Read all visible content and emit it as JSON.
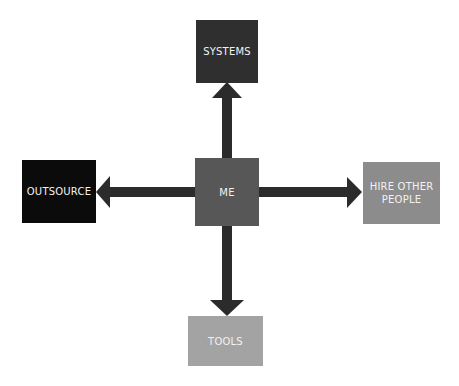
{
  "diagram": {
    "center": {
      "label": "ME",
      "color": "#575757"
    },
    "nodes": [
      {
        "id": "systems",
        "label": "SYSTEMS",
        "direction": "up",
        "color": "#2f2f2f"
      },
      {
        "id": "outsource",
        "label": "OUTSOURCE",
        "direction": "left",
        "color": "#0b0b0b"
      },
      {
        "id": "hire",
        "label": "HIRE OTHER PEOPLE",
        "direction": "right",
        "color": "#8c8c8c"
      },
      {
        "id": "tools",
        "label": "TOOLS",
        "direction": "down",
        "color": "#a3a3a3"
      }
    ],
    "arrow_color": "#2b2b2b"
  }
}
